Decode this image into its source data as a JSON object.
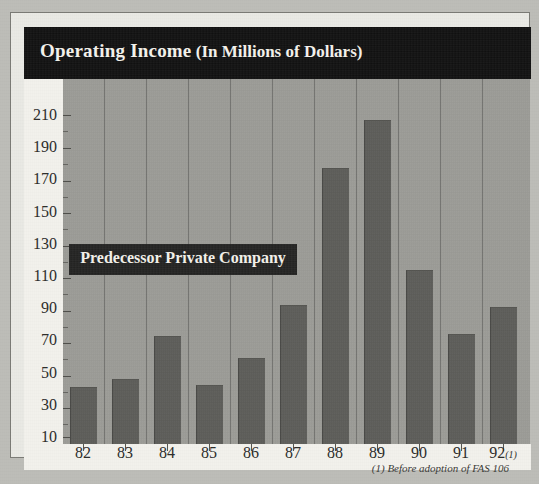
{
  "figure": {
    "title_main": "Operating Income",
    "title_sub": " (In Millions of Dollars)",
    "annotation_label": "Predecessor Private Company",
    "footnote": "(1) Before adoption of FAS 106",
    "colors": {
      "banner": "#0d0d0d",
      "plot_background": "#9d9d98",
      "bar_fill": "#5d5d59",
      "axis_strip": "#f2f1ec",
      "page_background": "#bdbdb8",
      "annotation_box": "#1f1f1e"
    }
  },
  "chart_data": {
    "type": "bar",
    "title": "Operating Income (In Millions of Dollars)",
    "xlabel": "",
    "ylabel": "",
    "categories": [
      "82",
      "83",
      "84",
      "85",
      "86",
      "87",
      "88",
      "89",
      "90",
      "91",
      "92"
    ],
    "category_labels": [
      "82",
      "83",
      "84",
      "85",
      "86",
      "87",
      "88",
      "89",
      "90",
      "91",
      "92(1)"
    ],
    "values": [
      41,
      46,
      73,
      42,
      59,
      92,
      177,
      207,
      114,
      74,
      91
    ],
    "ylim": [
      10,
      210
    ],
    "yticks": [
      210,
      190,
      170,
      150,
      130,
      110,
      90,
      70,
      50,
      30,
      10
    ],
    "ytick_labels": [
      "210",
      "190",
      "170",
      "150",
      "130",
      "110",
      "90",
      "70",
      "50",
      "30",
      "10"
    ],
    "grid": "vertical",
    "legend": "none",
    "annotations": [
      {
        "text": "Predecessor Private Company",
        "spans_categories": [
          "82",
          "83",
          "84",
          "85",
          "86",
          "87"
        ],
        "at_value": 125
      },
      {
        "text": "(1) Before adoption of FAS 106",
        "position": "below-axis-right"
      }
    ]
  }
}
